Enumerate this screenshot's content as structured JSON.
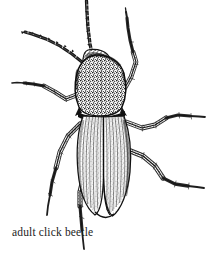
{
  "figure": {
    "caption": "adult click beetle",
    "subject": "click beetle",
    "view": "dorsal",
    "medium": "pen-and-ink stipple line drawing",
    "background_color": "#ffffff",
    "ink_color": "#1a1a1a",
    "width_px": 217,
    "height_px": 256
  },
  "anatomy": {
    "antenna_left_label": "left antenna",
    "antenna_right_label": "right antenna",
    "head_label": "head",
    "pronotum_label": "pronotum",
    "elytra_label": "elytra",
    "elytral_suture_label": "elytral suture",
    "leg_front_left_label": "front left leg",
    "leg_front_right_label": "front right leg",
    "leg_mid_left_label": "middle left leg",
    "leg_mid_right_label": "middle right leg",
    "leg_hind_left_label": "hind left leg",
    "leg_hind_right_label": "hind right leg"
  }
}
